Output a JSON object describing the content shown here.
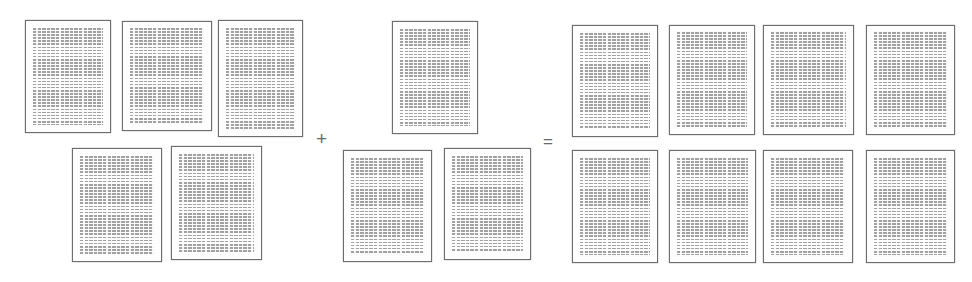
{
  "figure": {
    "type": "document-set-equation",
    "background_color": "#ffffff",
    "canvas": {
      "width": 972,
      "height": 282
    }
  },
  "style": {
    "page_border_color": "#6d6d6d",
    "page_fill_color": "#ffffff",
    "text_line_color": "#9a9a9a",
    "operator_color": "#6b6b6b"
  },
  "operators": [
    {
      "name": "plus",
      "symbol": "+",
      "x": 316,
      "y": 129
    },
    {
      "name": "equals",
      "symbol": "=",
      "x": 543,
      "y": 133
    }
  ],
  "groups": [
    {
      "id": "group-left",
      "role": "first-operand",
      "count": 5,
      "documents": [
        {
          "id": "left-doc-1",
          "x": 25,
          "y": 20,
          "w": 86,
          "h": 113
        },
        {
          "id": "left-doc-2",
          "x": 122,
          "y": 21,
          "w": 90,
          "h": 110
        },
        {
          "id": "left-doc-3",
          "x": 218,
          "y": 20,
          "w": 85,
          "h": 117
        },
        {
          "id": "left-doc-4",
          "x": 72,
          "y": 148,
          "w": 90,
          "h": 114
        },
        {
          "id": "left-doc-5",
          "x": 171,
          "y": 146,
          "w": 91,
          "h": 114
        }
      ]
    },
    {
      "id": "group-middle",
      "role": "second-operand",
      "count": 3,
      "documents": [
        {
          "id": "mid-doc-1",
          "x": 392,
          "y": 21,
          "w": 86,
          "h": 113
        },
        {
          "id": "mid-doc-2",
          "x": 343,
          "y": 150,
          "w": 89,
          "h": 112
        },
        {
          "id": "mid-doc-3",
          "x": 444,
          "y": 148,
          "w": 87,
          "h": 112
        }
      ]
    },
    {
      "id": "group-right",
      "role": "result",
      "count": 8,
      "documents": [
        {
          "id": "right-doc-1",
          "x": 572,
          "y": 25,
          "w": 86,
          "h": 112
        },
        {
          "id": "right-doc-2",
          "x": 669,
          "y": 25,
          "w": 86,
          "h": 110
        },
        {
          "id": "right-doc-3",
          "x": 763,
          "y": 25,
          "w": 91,
          "h": 110
        },
        {
          "id": "right-doc-4",
          "x": 866,
          "y": 25,
          "w": 89,
          "h": 110
        },
        {
          "id": "right-doc-5",
          "x": 572,
          "y": 150,
          "w": 86,
          "h": 113
        },
        {
          "id": "right-doc-6",
          "x": 669,
          "y": 150,
          "w": 87,
          "h": 113
        },
        {
          "id": "right-doc-7",
          "x": 763,
          "y": 150,
          "w": 90,
          "h": 113
        },
        {
          "id": "right-doc-8",
          "x": 866,
          "y": 150,
          "w": 89,
          "h": 113
        }
      ]
    }
  ]
}
